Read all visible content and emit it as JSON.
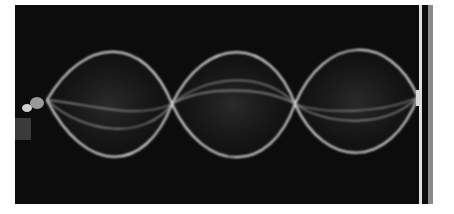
{
  "image": {
    "description": "Long-exposure photograph of a standing wave on a string showing three loops (antinodes) between two fixed ends",
    "loops": 3,
    "nodes_visible": 4,
    "colors": {
      "background": "#0c0c0c",
      "string": "#e8e8e8",
      "page": "#ffffff"
    }
  }
}
